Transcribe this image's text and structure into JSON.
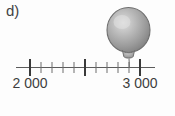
{
  "item": {
    "label": "d)"
  },
  "chart_data": {
    "type": "numberline",
    "title": "",
    "xlabel": "",
    "ylabel": "",
    "xlim": [
      2000,
      3000
    ],
    "grid": false,
    "legend": null,
    "major_ticks": [
      {
        "value": 2000,
        "label": "2 000"
      },
      {
        "value": 2500,
        "label": ""
      },
      {
        "value": 3000,
        "label": "3 000"
      }
    ],
    "minor_tick_step": 100,
    "minor_ticks": [
      2100,
      2200,
      2300,
      2400,
      2600,
      2700,
      2800,
      2900
    ],
    "tick_labels": [
      "2 000",
      "3 000"
    ],
    "markers": [
      {
        "name": "balloon",
        "value": 2900,
        "label": "",
        "shape": "balloon",
        "color": "#9b9b9b"
      }
    ],
    "axis_color": "#4a4a4a",
    "label_color": "#3d3d3d"
  },
  "labels": {
    "left_value": "2 000",
    "right_value": "3 000"
  },
  "colors": {
    "ink": "#3b3b3b",
    "axis": "#4a4a4a",
    "balloon_body": "#9b9b9b",
    "balloon_highlight": "#d8d8d8",
    "balloon_outline": "#6a6a6a",
    "background": "#fdfdfd"
  },
  "icons": {
    "balloon": "balloon-icon"
  }
}
